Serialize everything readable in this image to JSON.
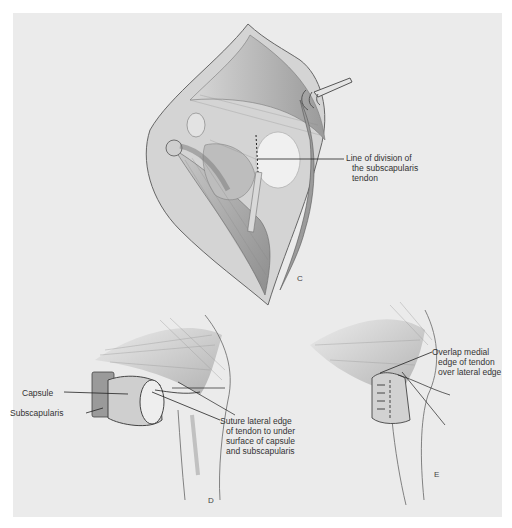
{
  "figure_c": {
    "letter": "C",
    "label_line_of_division": [
      "Line of division of",
      "the subscapularis",
      "tendon"
    ]
  },
  "figure_d": {
    "letter": "D",
    "label_capsule": "Capsule",
    "label_subscapularis": "Subscapularis",
    "label_suture": [
      "Suture lateral edge",
      "of tendon to under",
      "surface of capsule",
      "and subscapularis"
    ]
  },
  "figure_e": {
    "letter": "E",
    "label_overlap": [
      "Overlap medial",
      "edge of tendon",
      "over lateral edge"
    ]
  },
  "colors": {
    "background": "#ebebeb",
    "page": "#ffffff",
    "ink": "#333333"
  }
}
